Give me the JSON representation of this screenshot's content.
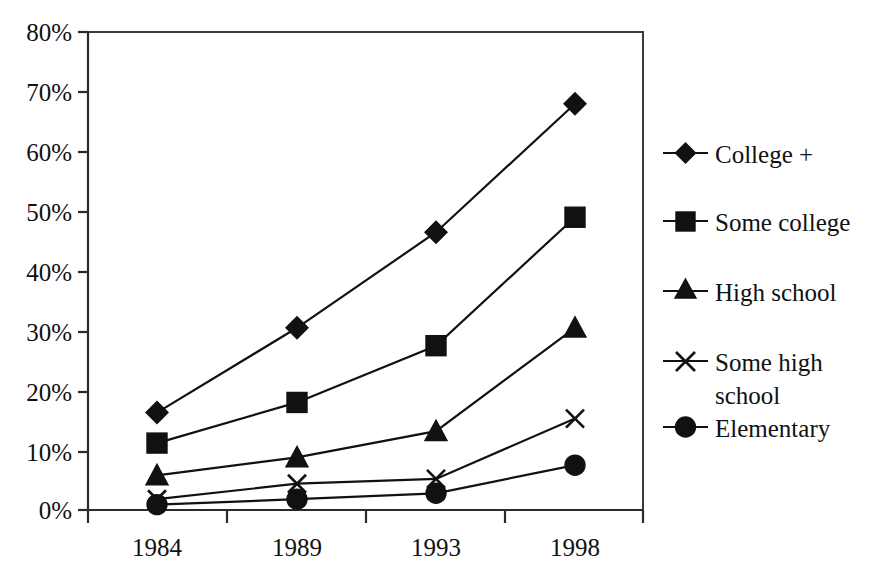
{
  "chart_data": {
    "type": "line",
    "title": "",
    "xlabel": "",
    "ylabel": "",
    "categories": [
      "1984",
      "1989",
      "1993",
      "1998"
    ],
    "ylim": [
      0,
      80
    ],
    "ytick_values": [
      0,
      10,
      20,
      30,
      40,
      50,
      60,
      70,
      80
    ],
    "ytick_labels": [
      "0%",
      "10%",
      "20%",
      "30%",
      "40%",
      "50%",
      "60%",
      "70%",
      "80%"
    ],
    "grid": false,
    "legend_position": "right",
    "series": [
      {
        "name": "College +",
        "marker": "diamond",
        "color": "#111111",
        "values": [
          16.3,
          30.5,
          46.5,
          68.0
        ]
      },
      {
        "name": "Some college",
        "marker": "square",
        "color": "#111111",
        "values": [
          11.2,
          18.0,
          27.5,
          49.0
        ]
      },
      {
        "name": "High school",
        "marker": "triangle",
        "color": "#111111",
        "values": [
          5.8,
          8.8,
          13.2,
          30.5
        ]
      },
      {
        "name": "Some high school",
        "marker": "x",
        "color": "#111111",
        "values": [
          1.8,
          4.4,
          5.2,
          15.3
        ]
      },
      {
        "name": "Elementary",
        "marker": "circle",
        "color": "#111111",
        "values": [
          0.9,
          1.8,
          2.8,
          7.5
        ]
      }
    ]
  },
  "legend": {
    "items": [
      {
        "label": "College +"
      },
      {
        "label": "Some college"
      },
      {
        "label": "High school"
      },
      {
        "label": "Some high",
        "label2": "school"
      },
      {
        "label": "Elementary"
      }
    ]
  },
  "axes": {
    "y_labels": [
      "80%",
      "70%",
      "60%",
      "50%",
      "40%",
      "30%",
      "20%",
      "10%",
      "0%"
    ],
    "x_labels": [
      "1984",
      "1989",
      "1993",
      "1998"
    ]
  }
}
